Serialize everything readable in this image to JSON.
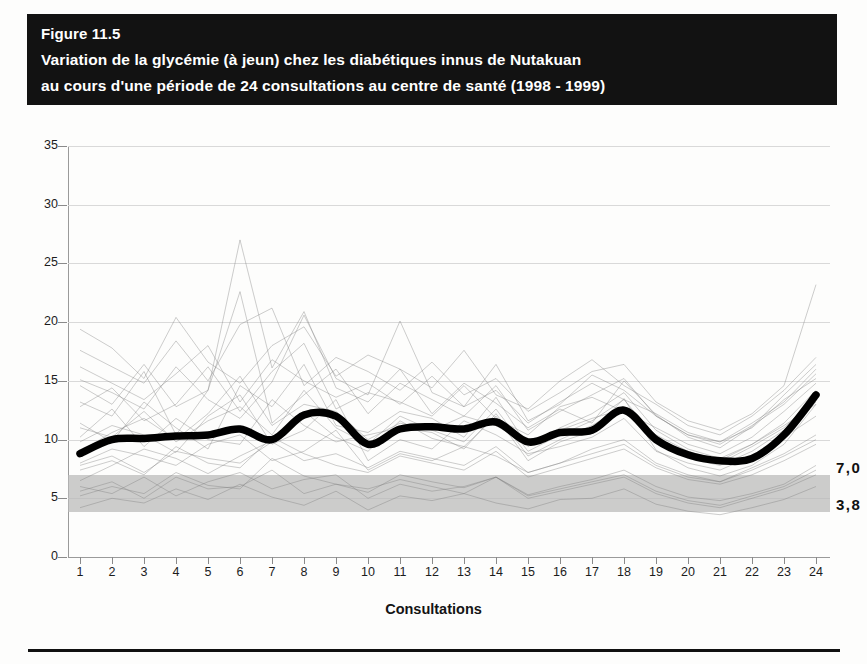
{
  "figure": {
    "number_label": "Figure 11.5",
    "title_line1": "Variation de la glycémie (à jeun) chez les diabétiques innus de Nutakuan",
    "title_line2": "au cours d'une période de 24 consultations au centre de santé (1998 - 1999)"
  },
  "annotations": {
    "band_upper_label": "7,0",
    "band_lower_label": "3,8"
  },
  "colors": {
    "banner_background": "#121212",
    "banner_text": "#ffffff",
    "mean_line": "#000000",
    "normal_range_band": "#b9b9b9",
    "gridline": "#d9d9d9",
    "axis": "#8a8a8a",
    "patient_traces": "#7b7b7b"
  },
  "chart_data": {
    "type": "line",
    "title": "Variation de la glycémie (à jeun) chez les diabétiques innus de Nutakuan au cours d'une période de 24 consultations au centre de santé (1998 - 1999)",
    "subtitle": "Figure 11.5",
    "xlabel": "Consultations",
    "ylabel": "",
    "x": [
      1,
      2,
      3,
      4,
      5,
      6,
      7,
      8,
      9,
      10,
      11,
      12,
      13,
      14,
      15,
      16,
      17,
      18,
      19,
      20,
      21,
      22,
      23,
      24
    ],
    "xticklabels": [
      "1",
      "2",
      "3",
      "4",
      "5",
      "6",
      "7",
      "8",
      "9",
      "10",
      "11",
      "12",
      "13",
      "14",
      "15",
      "16",
      "17",
      "18",
      "19",
      "20",
      "21",
      "22",
      "23",
      "24"
    ],
    "yticks": [
      0,
      5,
      10,
      15,
      20,
      25,
      30,
      35
    ],
    "yticklabels": [
      "0",
      "5",
      "10",
      "15",
      "20",
      "25",
      "30",
      "35"
    ],
    "xlim": [
      1,
      24
    ],
    "ylim": [
      0,
      35
    ],
    "grid": true,
    "legend": false,
    "series": [
      {
        "name": "Moyenne de la glycémie à jeun",
        "style": "thick-black-line",
        "values": [
          8.8,
          10.0,
          10.1,
          10.3,
          10.4,
          10.9,
          10.0,
          12.1,
          12.0,
          9.6,
          10.9,
          11.1,
          10.9,
          11.5,
          9.8,
          10.6,
          10.8,
          12.5,
          10.0,
          8.7,
          8.2,
          8.4,
          10.4,
          13.8
        ]
      }
    ],
    "bands": [
      {
        "name": "Valeurs normales de la glycémie à jeun",
        "y_min": 3.8,
        "y_max": 7.0,
        "label_upper": "7,0",
        "label_lower": "3,8",
        "color": "#b9b9b9"
      }
    ],
    "background_traces": {
      "description": "Tracés individuels fins de chaque patient en arrière-plan",
      "count": 20,
      "series": [
        {
          "name": "patient-1",
          "values": [
            6.5,
            7.8,
            9.2,
            8.4,
            7.1,
            8.6,
            9.9,
            12.4,
            10.2,
            9.0,
            11.6,
            10.1,
            9.4,
            12.0,
            8.2,
            9.8,
            10.7,
            13.5,
            9.1,
            7.6,
            6.9,
            7.8,
            9.6,
            13.0
          ]
        },
        {
          "name": "patient-2",
          "values": [
            13.2,
            12.0,
            15.8,
            10.4,
            14.2,
            27.0,
            16.1,
            20.9,
            14.4,
            13.2,
            16.0,
            12.2,
            14.8,
            13.1,
            11.0,
            12.6,
            11.4,
            15.0,
            12.1,
            10.2,
            9.3,
            11.1,
            13.8,
            16.4
          ]
        },
        {
          "name": "patient-3",
          "values": [
            5.2,
            6.0,
            5.4,
            7.2,
            6.1,
            5.8,
            8.4,
            6.9,
            6.2,
            5.5,
            7.0,
            6.4,
            5.9,
            6.8,
            5.3,
            6.0,
            6.6,
            7.4,
            6.0,
            5.1,
            4.8,
            5.4,
            6.2,
            7.8
          ]
        },
        {
          "name": "patient-4",
          "values": [
            15.1,
            14.0,
            12.6,
            16.2,
            13.4,
            11.8,
            14.9,
            20.6,
            15.2,
            13.8,
            20.1,
            14.0,
            12.8,
            16.4,
            11.6,
            13.0,
            15.5,
            14.2,
            12.0,
            10.4,
            9.8,
            11.0,
            13.4,
            15.2
          ]
        },
        {
          "name": "patient-5",
          "values": [
            9.8,
            11.2,
            10.4,
            8.9,
            12.0,
            13.8,
            9.6,
            10.8,
            13.4,
            8.2,
            10.0,
            9.2,
            11.6,
            10.4,
            8.8,
            9.4,
            10.2,
            11.8,
            9.0,
            8.0,
            7.4,
            8.6,
            10.2,
            12.0
          ]
        },
        {
          "name": "patient-6",
          "values": [
            4.2,
            5.0,
            4.6,
            5.8,
            4.9,
            6.2,
            5.1,
            4.4,
            5.6,
            4.0,
            5.2,
            4.8,
            5.4,
            4.6,
            4.1,
            4.9,
            5.0,
            5.8,
            4.5,
            3.9,
            3.6,
            4.2,
            4.9,
            6.0
          ]
        },
        {
          "name": "patient-7",
          "values": [
            11.4,
            9.8,
            13.2,
            11.0,
            9.2,
            14.6,
            12.8,
            16.4,
            11.2,
            10.6,
            12.4,
            11.8,
            10.2,
            13.6,
            9.4,
            11.0,
            12.2,
            14.0,
            10.8,
            9.2,
            8.4,
            9.6,
            11.4,
            14.2
          ]
        },
        {
          "name": "patient-8",
          "values": [
            17.6,
            16.2,
            14.8,
            18.4,
            15.0,
            19.8,
            21.2,
            14.6,
            17.0,
            15.8,
            14.2,
            16.6,
            13.8,
            15.2,
            12.4,
            14.0,
            15.8,
            16.4,
            13.2,
            11.6,
            10.8,
            12.2,
            14.6,
            23.2
          ]
        },
        {
          "name": "patient-9",
          "values": [
            7.4,
            8.2,
            7.0,
            9.4,
            8.0,
            7.6,
            10.2,
            8.8,
            7.8,
            7.2,
            8.6,
            8.0,
            7.4,
            9.0,
            6.8,
            7.6,
            8.4,
            9.2,
            7.6,
            6.6,
            6.2,
            7.0,
            8.2,
            9.6
          ]
        },
        {
          "name": "patient-10",
          "values": [
            12.8,
            14.4,
            11.6,
            13.0,
            16.2,
            12.4,
            15.8,
            18.2,
            12.6,
            14.0,
            13.2,
            12.0,
            14.6,
            11.8,
            10.4,
            12.8,
            13.6,
            12.4,
            11.0,
            9.6,
            8.8,
            10.2,
            12.4,
            14.8
          ]
        },
        {
          "name": "patient-11",
          "values": [
            6.0,
            5.4,
            6.8,
            5.2,
            6.4,
            7.2,
            5.8,
            6.6,
            7.0,
            5.0,
            6.2,
            5.6,
            6.0,
            6.8,
            5.2,
            5.8,
            6.4,
            7.0,
            5.6,
            4.8,
            4.4,
            5.2,
            6.0,
            7.4
          ]
        },
        {
          "name": "patient-12",
          "values": [
            10.2,
            12.6,
            9.4,
            11.8,
            10.0,
            9.6,
            13.4,
            11.2,
            9.8,
            10.4,
            11.0,
            10.6,
            9.2,
            12.2,
            8.6,
            10.0,
            11.2,
            12.8,
            9.8,
            8.4,
            7.8,
            9.0,
            10.8,
            13.2
          ]
        },
        {
          "name": "patient-13",
          "values": [
            14.6,
            13.0,
            16.4,
            12.8,
            14.2,
            22.6,
            11.4,
            13.8,
            16.0,
            12.2,
            14.8,
            13.4,
            12.0,
            14.6,
            10.8,
            12.4,
            13.8,
            15.2,
            12.0,
            10.4,
            9.6,
            11.2,
            13.0,
            15.6
          ]
        },
        {
          "name": "patient-14",
          "values": [
            8.0,
            9.2,
            8.6,
            7.8,
            9.6,
            10.4,
            8.2,
            9.0,
            10.8,
            7.4,
            8.8,
            8.2,
            9.4,
            8.6,
            7.2,
            8.0,
            9.2,
            10.0,
            8.0,
            7.0,
            6.4,
            7.6,
            8.8,
            10.4
          ]
        },
        {
          "name": "patient-15",
          "values": [
            19.4,
            17.8,
            15.2,
            20.4,
            16.6,
            14.8,
            18.0,
            19.6,
            15.4,
            17.2,
            16.0,
            14.4,
            17.6,
            13.8,
            12.6,
            15.0,
            16.8,
            14.6,
            13.0,
            11.2,
            10.4,
            12.0,
            14.2,
            17.0
          ]
        },
        {
          "name": "patient-16",
          "values": [
            5.6,
            6.4,
            5.0,
            6.8,
            5.8,
            6.0,
            7.4,
            5.4,
            6.2,
            5.8,
            6.6,
            6.0,
            5.4,
            6.8,
            5.0,
            5.6,
            6.2,
            6.8,
            5.4,
            4.6,
            4.2,
            5.0,
            5.8,
            7.0
          ]
        },
        {
          "name": "patient-17",
          "values": [
            11.0,
            10.2,
            12.4,
            9.8,
            11.6,
            12.8,
            10.4,
            14.2,
            11.0,
            9.6,
            12.0,
            10.8,
            9.8,
            12.6,
            9.0,
            10.4,
            11.6,
            13.4,
            10.2,
            8.8,
            8.0,
            9.4,
            11.0,
            13.6
          ]
        },
        {
          "name": "patient-18",
          "values": [
            16.2,
            14.8,
            13.4,
            15.6,
            18.0,
            13.2,
            16.8,
            15.0,
            13.6,
            14.8,
            13.0,
            15.4,
            12.8,
            14.2,
            11.4,
            13.2,
            14.8,
            13.4,
            12.2,
            10.6,
            9.8,
            11.4,
            13.2,
            16.0
          ]
        },
        {
          "name": "patient-19",
          "values": [
            7.8,
            8.6,
            7.2,
            9.0,
            8.4,
            8.0,
            9.8,
            8.2,
            8.8,
            7.6,
            9.0,
            8.4,
            7.8,
            9.4,
            7.2,
            8.0,
            8.8,
            9.6,
            7.8,
            6.8,
            6.4,
            7.4,
            8.6,
            10.0
          ]
        },
        {
          "name": "patient-20",
          "values": [
            9.0,
            10.6,
            11.8,
            10.0,
            12.2,
            15.4,
            11.2,
            13.0,
            12.4,
            10.0,
            11.4,
            10.8,
            12.0,
            11.2,
            9.6,
            10.8,
            11.8,
            12.6,
            10.4,
            9.0,
            8.2,
            9.6,
            11.2,
            13.0
          ]
        }
      ]
    }
  }
}
